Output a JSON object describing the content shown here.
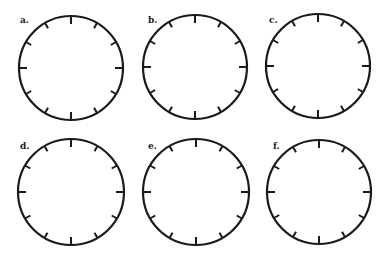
{
  "figure": {
    "stroke_color": "#1a1a1a",
    "background": "#ffffff",
    "clocks": [
      {
        "label": "a.",
        "cx": 71,
        "cy": 68,
        "r": 52,
        "label_x": 20,
        "label_y": 16
      },
      {
        "label": "b.",
        "cx": 195,
        "cy": 67,
        "r": 52,
        "label_x": 148,
        "label_y": 16
      },
      {
        "label": "c.",
        "cx": 318,
        "cy": 66,
        "r": 52,
        "label_x": 269,
        "label_y": 16
      },
      {
        "label": "d.",
        "cx": 71,
        "cy": 192,
        "r": 53,
        "label_x": 20,
        "label_y": 142
      },
      {
        "label": "e.",
        "cx": 196,
        "cy": 192,
        "r": 53,
        "label_x": 148,
        "label_y": 142
      },
      {
        "label": "f.",
        "cx": 319,
        "cy": 192,
        "r": 52,
        "label_x": 273,
        "label_y": 142
      }
    ],
    "ticks_per_clock": 12
  }
}
